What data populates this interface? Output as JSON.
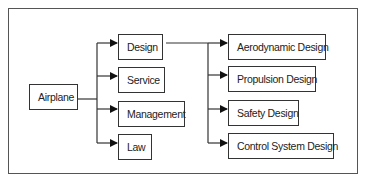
{
  "diagram": {
    "type": "tree",
    "colors": {
      "line": "#333333",
      "frame": "#555555",
      "text": "#222222",
      "background": "#ffffff"
    },
    "root": {
      "id": "airplane",
      "label": "Airplane"
    },
    "level1": [
      {
        "id": "design",
        "label": "Design"
      },
      {
        "id": "service",
        "label": "Service"
      },
      {
        "id": "management",
        "label": "Management"
      },
      {
        "id": "law",
        "label": "Law"
      }
    ],
    "level2_parent": "design",
    "level2": [
      {
        "id": "aerodynamic-design",
        "label": "Aerodynamic Design"
      },
      {
        "id": "propulsion-design",
        "label": "Propulsion Design"
      },
      {
        "id": "safety-design",
        "label": "Safety Design"
      },
      {
        "id": "control-system-design",
        "label": "Control System Design"
      }
    ],
    "edges": [
      {
        "from": "airplane",
        "to": "design"
      },
      {
        "from": "airplane",
        "to": "service"
      },
      {
        "from": "airplane",
        "to": "management"
      },
      {
        "from": "airplane",
        "to": "law"
      },
      {
        "from": "design",
        "to": "aerodynamic-design"
      },
      {
        "from": "design",
        "to": "propulsion-design"
      },
      {
        "from": "design",
        "to": "safety-design"
      },
      {
        "from": "design",
        "to": "control-system-design"
      }
    ]
  }
}
